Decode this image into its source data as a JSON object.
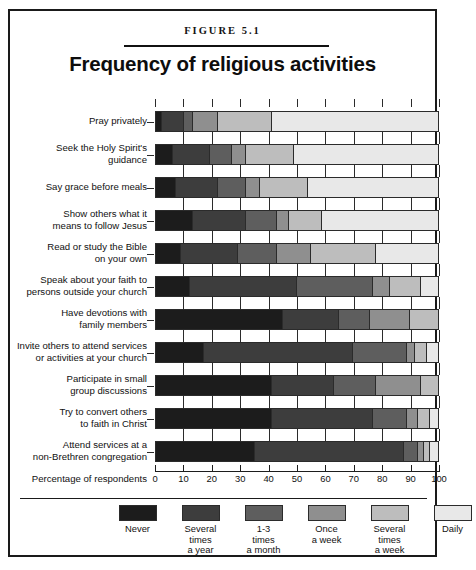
{
  "figure": {
    "number": "FIGURE 5.1",
    "title": "Frequency of religious activities"
  },
  "chart_data": {
    "type": "bar",
    "orientation": "horizontal",
    "stacked": true,
    "title": "Frequency of religious activities",
    "subtitle": "FIGURE 5.1",
    "xlabel": "Percentage of respondents",
    "ylabel": "",
    "xlim": [
      0,
      100
    ],
    "xticks": [
      0,
      10,
      20,
      30,
      40,
      50,
      60,
      70,
      80,
      90,
      100
    ],
    "xticklabels": [
      "0",
      "10",
      "20",
      "30",
      "40",
      "50",
      "60",
      "70",
      "80",
      "90",
      "100"
    ],
    "grid": true,
    "legend_position": "bottom",
    "series": [
      {
        "name": "Never",
        "color": "#1c1c1c",
        "values": [
          2,
          6,
          7,
          13,
          9,
          12,
          45,
          17,
          41,
          41,
          35
        ]
      },
      {
        "name": "Several times a year",
        "color": "#3d3d3d",
        "values": [
          8,
          13,
          15,
          19,
          20,
          38,
          20,
          53,
          22,
          36,
          53
        ]
      },
      {
        "name": "1-3 times a month",
        "color": "#5e5e5e",
        "values": [
          3,
          8,
          10,
          11,
          14,
          27,
          11,
          19,
          15,
          12,
          5
        ]
      },
      {
        "name": "Once a week",
        "color": "#8f8f8f",
        "values": [
          9,
          5,
          5,
          4,
          12,
          6,
          14,
          3,
          16,
          4,
          2
        ]
      },
      {
        "name": "Several times a week",
        "color": "#bdbdbd",
        "values": [
          19,
          17,
          17,
          12,
          23,
          11,
          10,
          4,
          6,
          4,
          2
        ]
      },
      {
        "name": "Daily",
        "color": "#e8e8e8",
        "values": [
          59,
          51,
          46,
          41,
          22,
          6,
          0,
          4,
          0,
          3,
          3
        ]
      }
    ],
    "categories": [
      "Pray privately",
      "Seek the Holy Spirit's\nguidance",
      "Say grace before meals",
      "Show others what it\nmeans to follow Jesus",
      "Read or study the Bible\non your own",
      "Speak about your faith to\npersons outside your church",
      "Have devotions with\nfamily members",
      "Invite others to attend services\nor activities at your church",
      "Participate in small\ngroup discussions",
      "Try to convert others\nto faith in Christ",
      "Attend services at a\nnon-Brethren congregation"
    ]
  },
  "legend": {
    "items": [
      {
        "label": "Never",
        "color": "#1c1c1c"
      },
      {
        "label": "Several\ntimes\na year",
        "color": "#3d3d3d"
      },
      {
        "label": "1-3\ntimes\na month",
        "color": "#5e5e5e"
      },
      {
        "label": "Once\na week",
        "color": "#8f8f8f"
      },
      {
        "label": "Several\ntimes\na week",
        "color": "#bdbdbd"
      },
      {
        "label": "Daily",
        "color": "#e8e8e8"
      }
    ]
  }
}
